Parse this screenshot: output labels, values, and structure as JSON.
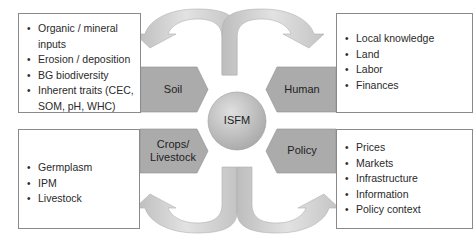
{
  "center": {
    "label": "ISFM"
  },
  "pillars": {
    "soil": {
      "label": "Soil"
    },
    "human": {
      "label": "Human"
    },
    "crops": {
      "label_line1": "Crops/",
      "label_line2": "Livestock"
    },
    "policy": {
      "label": "Policy"
    }
  },
  "boxes": {
    "soil_factors": [
      "Organic / mineral inputs",
      "Erosion / deposition",
      "BG biodiversity",
      "Inherent traits (CEC, SOM,  pH, WHC)"
    ],
    "human_factors": [
      "Local knowledge",
      "Land",
      "Labor",
      "Finances"
    ],
    "crops_factors": [
      "Germplasm",
      "IPM",
      "Livestock"
    ],
    "policy_factors": [
      "Prices",
      "Markets",
      "Infrastructure",
      "Information",
      "Policy context"
    ]
  },
  "colors": {
    "pillar_fill": "#ababab",
    "arrow_fill": "#cfcfcf",
    "circle_fill": "#c4c4c4",
    "border": "#8a8a8a"
  }
}
